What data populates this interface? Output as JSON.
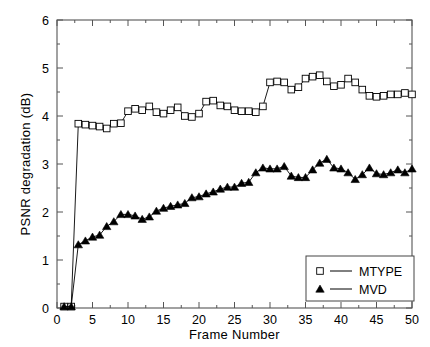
{
  "chart_data": {
    "type": "line",
    "title": "",
    "xlabel": "Frame Number",
    "ylabel": "PSNR degradation (dB)",
    "xlim": [
      0,
      50
    ],
    "ylim": [
      0,
      6
    ],
    "xticks": [
      0,
      5,
      10,
      15,
      20,
      25,
      30,
      35,
      40,
      45,
      50
    ],
    "yticks": [
      0,
      1,
      2,
      3,
      4,
      5,
      6
    ],
    "xticklabels": [
      "0",
      "5",
      "10",
      "15",
      "20",
      "25",
      "30",
      "35",
      "40",
      "45",
      "50"
    ],
    "yticklabels": [
      "0",
      "1",
      "2",
      "3",
      "4",
      "5",
      "6"
    ],
    "grid": false,
    "minor_ticks": true,
    "legend_position": "lower right",
    "x": [
      1,
      2,
      3,
      4,
      5,
      6,
      7,
      8,
      9,
      10,
      11,
      12,
      13,
      14,
      15,
      16,
      17,
      18,
      19,
      20,
      21,
      22,
      23,
      24,
      25,
      26,
      27,
      28,
      29,
      30,
      31,
      32,
      33,
      34,
      35,
      36,
      37,
      38,
      39,
      40,
      41,
      42,
      43,
      44,
      45,
      46,
      47,
      48,
      49,
      50
    ],
    "series": [
      {
        "name": "MTYPE",
        "marker": "square-open",
        "color": "#000000",
        "values": [
          0.03,
          0.03,
          3.84,
          3.82,
          3.8,
          3.78,
          3.74,
          3.84,
          3.85,
          4.1,
          4.15,
          4.12,
          4.2,
          4.08,
          4.05,
          4.12,
          4.18,
          4.0,
          3.98,
          4.05,
          4.3,
          4.32,
          4.22,
          4.2,
          4.12,
          4.1,
          4.1,
          4.08,
          4.2,
          4.7,
          4.72,
          4.7,
          4.55,
          4.6,
          4.78,
          4.82,
          4.85,
          4.72,
          4.62,
          4.65,
          4.78,
          4.7,
          4.55,
          4.42,
          4.4,
          4.42,
          4.45,
          4.45,
          4.48,
          4.45
        ]
      },
      {
        "name": "MVD",
        "marker": "triangle-filled",
        "color": "#000000",
        "values": [
          0.03,
          0.03,
          1.32,
          1.4,
          1.48,
          1.52,
          1.7,
          1.8,
          1.95,
          1.95,
          1.92,
          1.85,
          1.9,
          2.02,
          2.08,
          2.12,
          2.15,
          2.18,
          2.3,
          2.32,
          2.38,
          2.42,
          2.48,
          2.52,
          2.52,
          2.6,
          2.62,
          2.82,
          2.92,
          2.9,
          2.9,
          2.95,
          2.75,
          2.72,
          2.72,
          2.88,
          3.02,
          3.1,
          2.92,
          2.9,
          2.82,
          2.68,
          2.78,
          2.92,
          2.8,
          2.78,
          2.82,
          2.88,
          2.82,
          2.9
        ]
      }
    ],
    "legend": [
      {
        "label": "MTYPE",
        "marker": "square-open"
      },
      {
        "label": "MVD",
        "marker": "triangle-filled"
      }
    ]
  }
}
